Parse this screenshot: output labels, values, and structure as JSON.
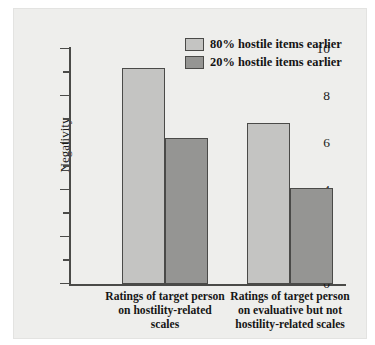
{
  "chart_data": {
    "type": "bar",
    "title": "",
    "xlabel": "",
    "ylabel": "Negativity",
    "ylim": [
      0,
      10
    ],
    "ytick_labels": [
      "0",
      "2",
      "4",
      "6",
      "8",
      "10"
    ],
    "ytick_values": [
      0,
      2,
      4,
      6,
      8,
      10
    ],
    "yminor_values": [
      1,
      3,
      5,
      7,
      9
    ],
    "grid": false,
    "legend_position": "top-right",
    "categories": [
      "Ratings of target person on hostility-related scales",
      "Ratings of target person on evaluative but not hostility-related scales"
    ],
    "category_lines": [
      [
        "Ratings of target person",
        "on hostility-related",
        "scales"
      ],
      [
        "Ratings of target person",
        "on evaluative but not",
        "hostility-related scales"
      ]
    ],
    "series": [
      {
        "name": "80% hostile items earlier",
        "color": "#c4c4c2",
        "values": [
          9.2,
          6.85
        ]
      },
      {
        "name": "20% hostile items earlier",
        "color": "#959593",
        "values": [
          6.2,
          4.1
        ]
      }
    ]
  },
  "colors": {
    "panel_background": "#eeeeec",
    "axis": "#4a4a48",
    "text": "#1b1b1b",
    "series_light": "#c4c4c2",
    "series_dark": "#959593"
  }
}
